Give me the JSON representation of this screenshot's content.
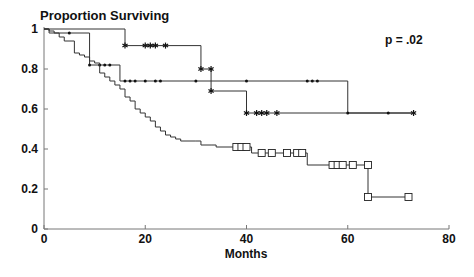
{
  "chart_data": {
    "type": "line",
    "subtype": "kaplan-meier step",
    "title": "Proportion Surviving",
    "xlabel": "Months",
    "ylabel": "",
    "annotation": "p = .02",
    "xlim": [
      0,
      80
    ],
    "ylim": [
      0,
      1
    ],
    "xticks": [
      0,
      20,
      40,
      60,
      80
    ],
    "yticks": [
      0,
      0.2,
      0.4,
      0.6,
      0.8,
      1
    ],
    "ytick_labels": [
      "0",
      "0.2",
      "0.4",
      "0.6",
      "0.8",
      "1"
    ],
    "grid": false,
    "legend": "none",
    "series": [
      {
        "name": "star-marker group",
        "marker": "star",
        "steps": [
          [
            0,
            1.0
          ],
          [
            16,
            1.0
          ],
          [
            16,
            0.917
          ],
          [
            31,
            0.917
          ],
          [
            31,
            0.8
          ],
          [
            33,
            0.8
          ],
          [
            33,
            0.69
          ],
          [
            40,
            0.69
          ],
          [
            40,
            0.58
          ],
          [
            73,
            0.58
          ]
        ],
        "censored": [
          [
            16,
            0.917
          ],
          [
            20,
            0.917
          ],
          [
            21,
            0.917
          ],
          [
            22,
            0.917
          ],
          [
            24,
            0.917
          ],
          [
            31,
            0.8
          ],
          [
            33,
            0.8
          ],
          [
            33,
            0.69
          ],
          [
            40,
            0.58
          ],
          [
            42,
            0.58
          ],
          [
            43,
            0.58
          ],
          [
            44,
            0.58
          ],
          [
            46,
            0.58
          ],
          [
            73,
            0.58
          ]
        ]
      },
      {
        "name": "dot-marker group",
        "marker": "dot",
        "steps": [
          [
            0,
            1.0
          ],
          [
            1,
            1.0
          ],
          [
            1,
            0.98
          ],
          [
            9,
            0.98
          ],
          [
            9,
            0.82
          ],
          [
            15,
            0.82
          ],
          [
            15,
            0.74
          ],
          [
            60,
            0.74
          ],
          [
            60,
            0.58
          ],
          [
            73,
            0.58
          ]
        ],
        "censored": [
          [
            5,
            0.98
          ],
          [
            9,
            0.82
          ],
          [
            11,
            0.82
          ],
          [
            12,
            0.82
          ],
          [
            13,
            0.82
          ],
          [
            16,
            0.74
          ],
          [
            17,
            0.74
          ],
          [
            18,
            0.74
          ],
          [
            20,
            0.74
          ],
          [
            22,
            0.74
          ],
          [
            23,
            0.74
          ],
          [
            30,
            0.74
          ],
          [
            40,
            0.74
          ],
          [
            52,
            0.74
          ],
          [
            53,
            0.74
          ],
          [
            54,
            0.74
          ],
          [
            60,
            0.58
          ],
          [
            68,
            0.58
          ]
        ]
      },
      {
        "name": "square-marker group",
        "marker": "square",
        "steps": [
          [
            0,
            1.0
          ],
          [
            1,
            0.99
          ],
          [
            2,
            0.98
          ],
          [
            3,
            0.96
          ],
          [
            4,
            0.94
          ],
          [
            6,
            0.93
          ],
          [
            6,
            0.88
          ],
          [
            7,
            0.87
          ],
          [
            8,
            0.86
          ],
          [
            9,
            0.84
          ],
          [
            10,
            0.83
          ],
          [
            11,
            0.78
          ],
          [
            12,
            0.76
          ],
          [
            13,
            0.74
          ],
          [
            14,
            0.72
          ],
          [
            15,
            0.7
          ],
          [
            16,
            0.69
          ],
          [
            16,
            0.66
          ],
          [
            17,
            0.64
          ],
          [
            18,
            0.6
          ],
          [
            19,
            0.58
          ],
          [
            20,
            0.56
          ],
          [
            21,
            0.54
          ],
          [
            22,
            0.51
          ],
          [
            23,
            0.49
          ],
          [
            24,
            0.47
          ],
          [
            25,
            0.46
          ],
          [
            26,
            0.45
          ],
          [
            27,
            0.44
          ],
          [
            30,
            0.44
          ],
          [
            31,
            0.42
          ],
          [
            33,
            0.42
          ],
          [
            34,
            0.41
          ],
          [
            40,
            0.41
          ],
          [
            41,
            0.38
          ],
          [
            52,
            0.38
          ],
          [
            52,
            0.32
          ],
          [
            64,
            0.32
          ],
          [
            64,
            0.16
          ],
          [
            72,
            0.16
          ]
        ],
        "censored": [
          [
            38,
            0.41
          ],
          [
            39,
            0.41
          ],
          [
            40,
            0.41
          ],
          [
            43,
            0.38
          ],
          [
            45,
            0.38
          ],
          [
            48,
            0.38
          ],
          [
            50,
            0.38
          ],
          [
            51,
            0.38
          ],
          [
            57,
            0.32
          ],
          [
            58,
            0.32
          ],
          [
            59,
            0.32
          ],
          [
            61,
            0.32
          ],
          [
            64,
            0.32
          ],
          [
            64,
            0.16
          ],
          [
            72,
            0.16
          ]
        ]
      }
    ]
  }
}
